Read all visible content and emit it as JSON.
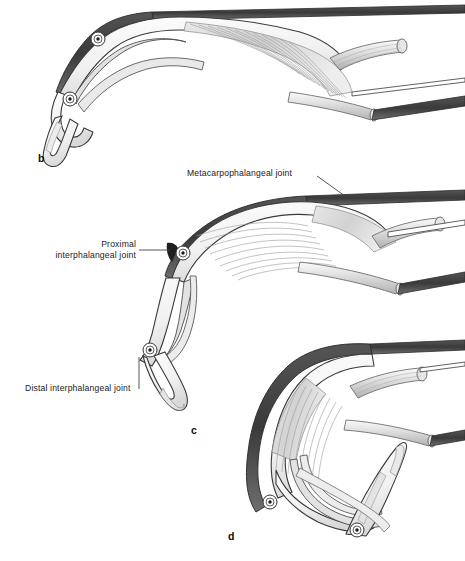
{
  "figure": {
    "background_color": "#ffffff",
    "width": 465,
    "height": 561,
    "style": "grayscale line art medical illustration"
  },
  "palette": {
    "outline_dark": "#2b2b2b",
    "outline_mid": "#6a6a6a",
    "bone_fill": "#f2f2f2",
    "bone_fill_shadow": "#dcdcdc",
    "tendon_fill": "#d9d9d9",
    "tendon_fill_light": "#ebebeb",
    "band_dark": "#3d3d3d",
    "joint_center": "#1a1a1a",
    "label_text": "#1a1a1a",
    "leader_line": "#444444"
  },
  "labels": [
    {
      "id": "mcp",
      "text": "Metacarpophalangeal joint",
      "x": 187,
      "y": 170,
      "align": "left",
      "leader": {
        "type": "diagonal",
        "x1": 317,
        "y1": 176,
        "x2": 345,
        "y2": 196
      }
    },
    {
      "id": "pip",
      "line1": "Proximal",
      "line2": "interphalangeal joint",
      "x": 46,
      "y": 244,
      "align": "right",
      "leader": {
        "type": "horizontal",
        "x1": 139,
        "y1": 250,
        "x2": 168,
        "y2": 250
      }
    },
    {
      "id": "dip",
      "text": "Distal interphalangeal joint",
      "x": 25,
      "y": 390,
      "align": "left",
      "leader": {
        "type": "vertical",
        "x1": 139,
        "y1": 389,
        "x2": 139,
        "y2": 358
      }
    }
  ],
  "panels": [
    {
      "id": "b",
      "letter": "b",
      "x": 38,
      "y": 160,
      "description": "partially flexed finger, lateral view, extensor hood and interosseous fibers visible"
    },
    {
      "id": "c",
      "letter": "c",
      "x": 191,
      "y": 425,
      "description": "further flexed finger showing metacarpophalangeal, proximal and distal interphalangeal joints"
    },
    {
      "id": "d",
      "letter": "d",
      "x": 228,
      "y": 531,
      "description": "fully flexed finger, extensor mechanism stretched over joints"
    }
  ],
  "joint_markers": [
    {
      "panel": "b",
      "cx": 98,
      "cy": 39,
      "r": 6.5
    },
    {
      "panel": "b",
      "cx": 70,
      "cy": 99,
      "r": 6.5
    },
    {
      "panel": "c",
      "cx": 183,
      "cy": 253,
      "r": 6.5
    },
    {
      "panel": "c",
      "cx": 150,
      "cy": 350,
      "r": 6.5
    },
    {
      "panel": "d",
      "cx": 270,
      "cy": 502,
      "r": 6.5
    },
    {
      "panel": "d",
      "cx": 357,
      "cy": 530,
      "r": 6.5
    }
  ]
}
